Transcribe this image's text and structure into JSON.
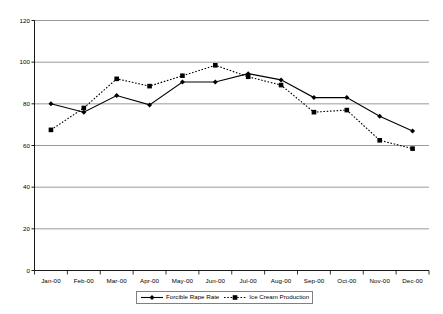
{
  "chart_data": {
    "type": "line",
    "title": "",
    "subtitle": "",
    "xlabel": "",
    "ylabel": "",
    "categories": [
      "Jan-00",
      "Feb-00",
      "Mar-00",
      "Apr-00",
      "May-00",
      "Jun-00",
      "Jul-00",
      "Aug-00",
      "Sep-00",
      "Oct-00",
      "Nov-00",
      "Dec-00"
    ],
    "series": [
      {
        "name": "Forcible Rape Rate",
        "marker": "diamond",
        "line_style": "solid",
        "color": "#000000",
        "values": [
          80,
          76,
          84,
          79.5,
          90.5,
          90.5,
          94.5,
          91.5,
          83,
          83,
          74,
          67
        ]
      },
      {
        "name": "Ice Cream Production",
        "marker": "square",
        "line_style": "dotted",
        "color": "#000000",
        "values": [
          67.5,
          78,
          92,
          88.5,
          93.5,
          98.5,
          93,
          89,
          76,
          77,
          62.5,
          58.5
        ]
      }
    ],
    "ylim": [
      0,
      120
    ],
    "yticks": [
      0,
      20,
      40,
      60,
      80,
      100,
      120
    ],
    "ytick_labels": [
      "0",
      "20",
      "40",
      "60",
      "80",
      "100",
      "120"
    ],
    "grid": true,
    "grid_axis": "y",
    "legend_position": "bottom",
    "legend_entries": [
      "Forcible Rape Rate",
      "Ice Cream Production"
    ]
  },
  "colors": {
    "axis": "#000000",
    "grid": "#808080",
    "series": "#000000",
    "background": "#ffffff"
  }
}
